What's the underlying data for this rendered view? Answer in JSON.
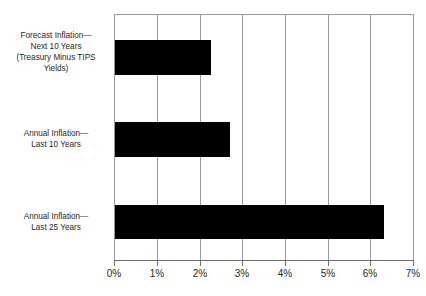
{
  "chart_data": {
    "type": "bar",
    "orientation": "horizontal",
    "title": "",
    "subtitle": "",
    "xlabel": "",
    "ylabel": "",
    "xlim": [
      0,
      7
    ],
    "grid": true,
    "legend": false,
    "bar_color": "#000000",
    "axis_color": "#9a9a9a",
    "xtick_labels": [
      "0%",
      "1%",
      "2%",
      "3%",
      "4%",
      "5%",
      "6%",
      "7%"
    ],
    "xtick_values": [
      0,
      1,
      2,
      3,
      4,
      5,
      6,
      7
    ],
    "categories": [
      "Forecast Inflation—Next 10 Years (Treasury Minus TIPS Yields)",
      "Annual Inflation—Last 10 Years",
      "Annual Inflation—Last 25 Years"
    ],
    "category_label_lines": [
      [
        "Forecast Inflation—",
        "Next 10 Years",
        "(Treasury Minus TIPS",
        "Yields)"
      ],
      [
        "Annual Inflation—",
        "Last 10 Years"
      ],
      [
        "Annual Inflation—",
        "Last 25 Years"
      ]
    ],
    "values": [
      2.25,
      2.7,
      6.3
    ],
    "value_unit": "%"
  },
  "ticks": {
    "t0": "0%",
    "t1": "1%",
    "t2": "2%",
    "t3": "3%",
    "t4": "4%",
    "t5": "5%",
    "t6": "6%",
    "t7": "7%"
  },
  "labels": {
    "cat0_line0": "Forecast Inflation—",
    "cat0_line1": "Next 10 Years",
    "cat0_line2": "(Treasury Minus TIPS",
    "cat0_line3": "Yields)",
    "cat1_line0": "Annual Inflation—",
    "cat1_line1": "Last 10 Years",
    "cat2_line0": "Annual Inflation—",
    "cat2_line1": "Last 25 Years"
  }
}
